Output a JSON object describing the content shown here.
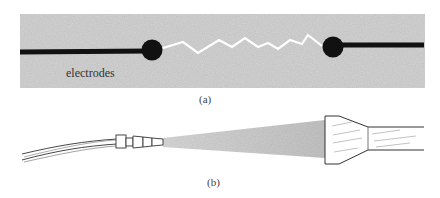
{
  "figure": {
    "panel_a": {
      "caption": "(a)",
      "label": "electrodes",
      "background_color": "#d4d4d4",
      "electrode_color": "#111111",
      "spark_color": "#ffffff"
    },
    "panel_b": {
      "caption": "(b)",
      "beam_color": "#c8c8c8",
      "line_color": "#333333"
    }
  }
}
